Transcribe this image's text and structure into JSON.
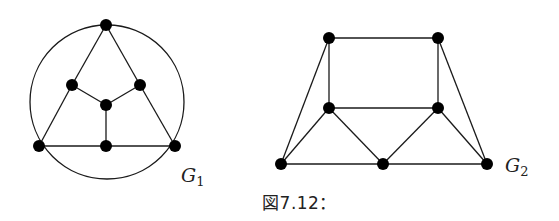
{
  "caption": "図7.12：",
  "graphs": [
    {
      "id": "G1",
      "label": "G",
      "subscript": "1",
      "label_pos": [
        181,
        182
      ],
      "circle": {
        "cx": 107,
        "cy": 102,
        "r": 77
      },
      "nodes": [
        {
          "id": "top",
          "x": 106,
          "y": 25
        },
        {
          "id": "mid-left",
          "x": 72,
          "y": 85
        },
        {
          "id": "mid-right",
          "x": 140,
          "y": 85
        },
        {
          "id": "center",
          "x": 106,
          "y": 105
        },
        {
          "id": "bottom-left",
          "x": 39,
          "y": 146
        },
        {
          "id": "bottom-mid",
          "x": 106,
          "y": 146
        },
        {
          "id": "bottom-right",
          "x": 175,
          "y": 146
        }
      ],
      "edges": [
        [
          "top",
          "mid-left"
        ],
        [
          "mid-left",
          "bottom-left"
        ],
        [
          "top",
          "mid-right"
        ],
        [
          "mid-right",
          "bottom-right"
        ],
        [
          "mid-left",
          "center"
        ],
        [
          "mid-right",
          "center"
        ],
        [
          "center",
          "bottom-mid"
        ],
        [
          "bottom-left",
          "bottom-mid"
        ],
        [
          "bottom-mid",
          "bottom-right"
        ]
      ]
    },
    {
      "id": "G2",
      "label": "G",
      "subscript": "2",
      "label_pos": [
        505,
        172
      ],
      "nodes": [
        {
          "id": "top-left",
          "x": 329,
          "y": 38
        },
        {
          "id": "top-right",
          "x": 438,
          "y": 38
        },
        {
          "id": "mid-left",
          "x": 329,
          "y": 108
        },
        {
          "id": "mid-right",
          "x": 438,
          "y": 108
        },
        {
          "id": "bottom-left",
          "x": 281,
          "y": 164
        },
        {
          "id": "bottom-mid",
          "x": 383,
          "y": 164
        },
        {
          "id": "bottom-right",
          "x": 487,
          "y": 164
        }
      ],
      "edges": [
        [
          "top-left",
          "top-right"
        ],
        [
          "top-left",
          "mid-left"
        ],
        [
          "top-right",
          "mid-right"
        ],
        [
          "mid-left",
          "mid-right"
        ],
        [
          "top-left",
          "bottom-left"
        ],
        [
          "top-right",
          "bottom-right"
        ],
        [
          "mid-left",
          "bottom-left"
        ],
        [
          "mid-left",
          "bottom-mid"
        ],
        [
          "mid-right",
          "bottom-mid"
        ],
        [
          "mid-right",
          "bottom-right"
        ],
        [
          "bottom-left",
          "bottom-mid"
        ],
        [
          "bottom-mid",
          "bottom-right"
        ]
      ]
    }
  ],
  "style": {
    "node_radius": 6,
    "edge_color": "#1a1a1a",
    "node_color": "#000000"
  }
}
